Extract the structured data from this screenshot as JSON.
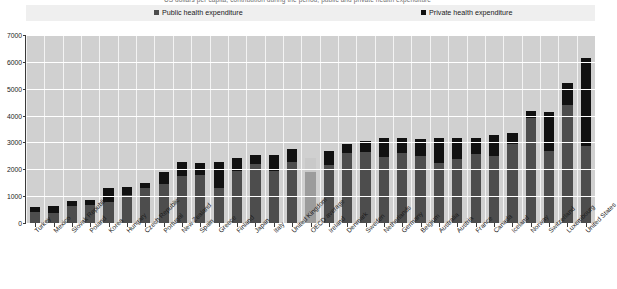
{
  "subtitle": "US dollars per capita, contribution during the period, public and private health expenditure",
  "legend": {
    "public": {
      "label": "Public health expenditure",
      "color": "#4d4d4d",
      "icon": "square-swatch"
    },
    "private": {
      "label": "Private health expenditure",
      "color": "#111111",
      "icon": "square-swatch"
    }
  },
  "chart_data": {
    "type": "bar",
    "stacked": true,
    "title": "",
    "subtitle": "US dollars per capita, contribution during the period, public and private health expenditure",
    "xlabel": "",
    "ylabel": "",
    "ylim": [
      0,
      7000
    ],
    "yticks": [
      0,
      1000,
      2000,
      3000,
      4000,
      5000,
      6000,
      7000
    ],
    "ytick_labels": [
      "0",
      "1000",
      "2000",
      "3000",
      "4000",
      "5000",
      "6000",
      "7000"
    ],
    "grid": true,
    "legend_position": "top",
    "highlight_category": "OECD average",
    "categories": [
      "Turkey",
      "Mexico",
      "Slovak Republic",
      "Poland",
      "Korea",
      "Hungary",
      "Czech Republic",
      "Portugal",
      "New Zealand",
      "Spain",
      "Greece",
      "Finland",
      "Japan",
      "Italy",
      "United Kingdom",
      "OECD average",
      "Ireland",
      "Denmark",
      "Sweden",
      "Netherlands",
      "Germany",
      "Belgium",
      "Australia",
      "Austria",
      "France",
      "Canada",
      "Iceland",
      "Norway",
      "Switzerland",
      "Luxembourg",
      "United States"
    ],
    "series": [
      {
        "name": "Public health expenditure",
        "color": "#4d4d4d",
        "values": [
          400,
          380,
          640,
          680,
          770,
          1050,
          1300,
          1460,
          1750,
          1800,
          1300,
          1950,
          2200,
          1950,
          2280,
          1900,
          2150,
          2600,
          2650,
          2450,
          2600,
          2480,
          2250,
          2400,
          2560,
          2500,
          2960,
          3900,
          2700,
          4400,
          2850
        ]
      },
      {
        "name": "Private health expenditure",
        "color": "#111111",
        "values": [
          190,
          260,
          180,
          190,
          530,
          280,
          200,
          450,
          520,
          450,
          980,
          480,
          350,
          600,
          470,
          530,
          550,
          350,
          400,
          700,
          580,
          640,
          900,
          760,
          620,
          760,
          400,
          280,
          1420,
          800,
          3300
        ]
      }
    ]
  }
}
